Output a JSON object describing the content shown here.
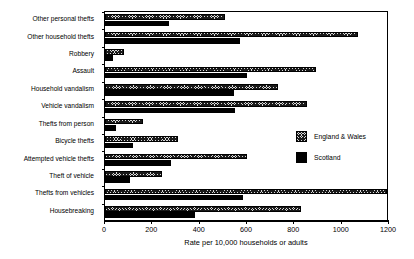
{
  "chart_data": {
    "type": "bar",
    "orientation": "horizontal",
    "title": "",
    "xlabel": "Rate per 10,000 households or adults",
    "ylabel": "",
    "xlim": [
      0,
      1200
    ],
    "xticks": [
      0,
      200,
      400,
      600,
      800,
      1000,
      1200
    ],
    "grid": false,
    "legend_position": "right-middle",
    "categories": [
      "Other personal thefts",
      "Other household thefts",
      "Robbery",
      "Assault",
      "Household vandalism",
      "Vehicle vandalism",
      "Thefts from person",
      "Bicycle thefts",
      "Attempted vehicle thefts",
      "Theft of vehicle",
      "Thefts from vehicles",
      "Housebreaking"
    ],
    "series": [
      {
        "name": "England & Wales",
        "color": "#d9d9d9",
        "pattern": "crosshatch",
        "values": [
          505,
          1070,
          80,
          890,
          730,
          855,
          160,
          310,
          600,
          240,
          1190,
          830
        ]
      },
      {
        "name": "Scotland",
        "color": "#000000",
        "pattern": "solid",
        "values": [
          270,
          570,
          35,
          600,
          545,
          550,
          45,
          120,
          280,
          105,
          585,
          380
        ]
      }
    ]
  },
  "legend": {
    "items": [
      {
        "label": "England & Wales"
      },
      {
        "label": "Scotland"
      }
    ]
  }
}
